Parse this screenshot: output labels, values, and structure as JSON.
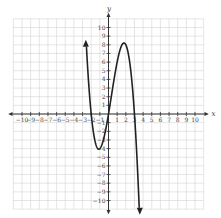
{
  "chart_data": {
    "type": "line",
    "title": "",
    "xlabel": "x",
    "ylabel": "y",
    "xlim": [
      -10,
      10
    ],
    "ylim": [
      -10,
      10
    ],
    "grid": true,
    "x_ticks": [
      -10,
      -9,
      -8,
      -7,
      -6,
      -5,
      -4,
      -3,
      -2,
      -1,
      1,
      2,
      3,
      4,
      5,
      6,
      7,
      8,
      9,
      10
    ],
    "y_ticks": [
      -10,
      -9,
      -8,
      -7,
      -6,
      -5,
      -4,
      -3,
      -2,
      -1,
      1,
      2,
      3,
      4,
      5,
      6,
      7,
      8,
      9,
      10
    ],
    "series": [
      {
        "name": "f(x)",
        "description": "Cubic polynomial with arrows at both ends; zeros near x=-2, 0, 3; local min near (-1.1,-4.1); local max near (1.8,8.2)",
        "x": [
          -2.7,
          -2.5,
          -2.25,
          -2,
          -1.75,
          -1.5,
          -1.25,
          -1,
          -0.75,
          -0.5,
          -0.25,
          0,
          0.25,
          0.5,
          0.75,
          1,
          1.25,
          1.5,
          1.75,
          2,
          2.25,
          2.5,
          2.75,
          3,
          3.25,
          3.5,
          3.6
        ],
        "y": [
          10.2,
          5.6,
          2.1,
          0,
          -1.5,
          -3.4,
          -3.9,
          -4,
          -3.5,
          -2.6,
          -1.4,
          0,
          1.5,
          3.1,
          4.6,
          6,
          7.1,
          7.9,
          8.2,
          8,
          7.3,
          5.8,
          3.4,
          0,
          -3.7,
          -8.3,
          -10.5
        ]
      }
    ]
  },
  "axes": {
    "x_name": "x",
    "y_name": "y"
  }
}
